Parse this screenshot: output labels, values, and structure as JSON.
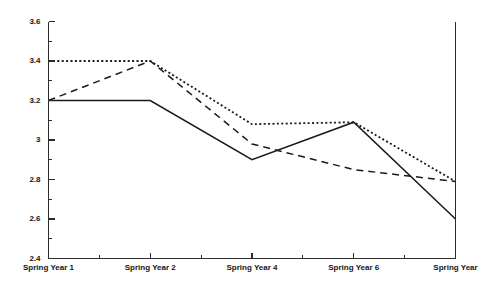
{
  "chart_data": {
    "type": "line",
    "title": "",
    "subtitle": "",
    "xlabel": "",
    "ylabel": "",
    "grid": false,
    "legend": "none",
    "ylim": [
      2.4,
      3.6
    ],
    "ytick_step": 0.2,
    "yminor_step": 0.1,
    "x": [
      1,
      2,
      4,
      6,
      8
    ],
    "categories": [
      "Spring Year 1",
      "Spring Year 2",
      "Spring Year 4",
      "Spring Year 6",
      "Spring Year"
    ],
    "ytick_labels": [
      "2.4",
      "2.6",
      "2.8",
      "3",
      "3.2",
      "3.4",
      "3.6"
    ],
    "ytick_values": [
      2.4,
      2.6,
      2.8,
      3.0,
      3.2,
      3.4,
      3.6
    ],
    "series": [
      {
        "name": "solid-series",
        "style": "solid",
        "color": "#1a1a1a",
        "values": [
          3.2,
          3.2,
          2.9,
          3.09,
          2.6
        ]
      },
      {
        "name": "dashed-series",
        "style": "dashed",
        "color": "#1a1a1a",
        "values": [
          3.2,
          3.4,
          2.98,
          2.85,
          2.79
        ]
      },
      {
        "name": "dotted-series",
        "style": "dotted",
        "color": "#1a1a1a",
        "values": [
          3.4,
          3.4,
          3.08,
          3.09,
          2.79
        ]
      }
    ]
  },
  "axes": {
    "frame_color": "#2b2b2b"
  }
}
